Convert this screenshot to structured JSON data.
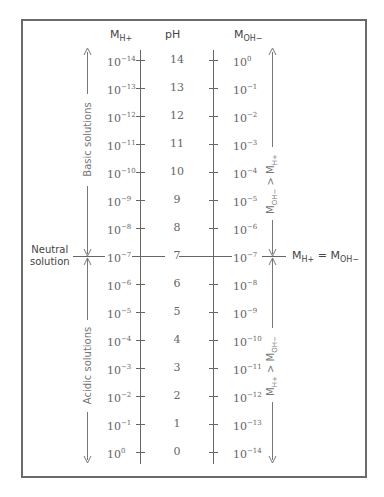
{
  "headers": {
    "left": {
      "base": "M",
      "sub": "H+"
    },
    "center": "pH",
    "right": {
      "base": "M",
      "sub": "OH−"
    }
  },
  "rows": [
    {
      "ph": "14",
      "h_exp": "−14",
      "oh_exp": "0"
    },
    {
      "ph": "13",
      "h_exp": "−13",
      "oh_exp": "−1"
    },
    {
      "ph": "12",
      "h_exp": "−12",
      "oh_exp": "−2"
    },
    {
      "ph": "11",
      "h_exp": "−11",
      "oh_exp": "−3"
    },
    {
      "ph": "10",
      "h_exp": "−10",
      "oh_exp": "−4"
    },
    {
      "ph": "9",
      "h_exp": "−9",
      "oh_exp": "−5"
    },
    {
      "ph": "8",
      "h_exp": "−8",
      "oh_exp": "−6"
    },
    {
      "ph": "7",
      "h_exp": "−7",
      "oh_exp": "−7"
    },
    {
      "ph": "6",
      "h_exp": "−6",
      "oh_exp": "−8"
    },
    {
      "ph": "5",
      "h_exp": "−5",
      "oh_exp": "−9"
    },
    {
      "ph": "4",
      "h_exp": "−4",
      "oh_exp": "−10"
    },
    {
      "ph": "3",
      "h_exp": "−3",
      "oh_exp": "−11"
    },
    {
      "ph": "2",
      "h_exp": "−2",
      "oh_exp": "−12"
    },
    {
      "ph": "1",
      "h_exp": "−1",
      "oh_exp": "−13"
    },
    {
      "ph": "0",
      "h_exp": "0",
      "oh_exp": "−14"
    }
  ],
  "base": "10",
  "labels": {
    "basic": "Basic solutions",
    "acidic": "Acidic solutions",
    "neutral_line1": "Neutral",
    "neutral_line2": "solution",
    "oh_gt_h": {
      "a": "M",
      "a_sub": "OH−",
      "op": " > ",
      "b": "M",
      "b_sub": "H+"
    },
    "h_gt_oh": {
      "a": "M",
      "a_sub": "H+",
      "op": " > ",
      "b": "M",
      "b_sub": "OH−"
    },
    "equal": {
      "a": "M",
      "a_sub": "H+",
      "op": " = ",
      "b": "M",
      "b_sub": "OH−"
    }
  },
  "colors": {
    "line": "#666666",
    "frame": "#6a6a6a",
    "text": "#555555"
  }
}
